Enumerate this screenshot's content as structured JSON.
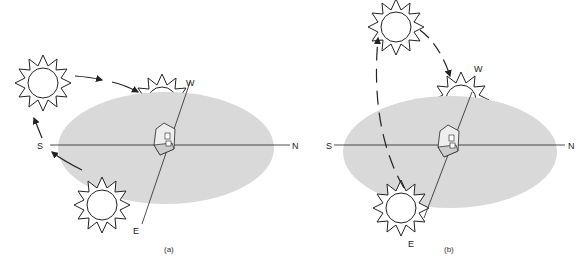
{
  "figure": {
    "panels": [
      {
        "id": "a",
        "caption": "(a)",
        "labels": {
          "south": "S",
          "north": "N",
          "west": "W",
          "east": "E"
        },
        "description": "Winter sun path: low arc from E through S to W"
      },
      {
        "id": "b",
        "caption": "(b)",
        "labels": {
          "south": "S",
          "north": "N",
          "west": "W",
          "east": "E"
        },
        "description": "Summer sun path: high arc from E overhead to W"
      }
    ],
    "colors": {
      "ground": "#d9d9d9",
      "line": "#222222",
      "sun_fill": "#ffffff"
    }
  }
}
